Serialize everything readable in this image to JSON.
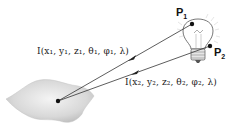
{
  "diagram": {
    "points": [
      {
        "id": "P1",
        "label": "P",
        "subscript": "1"
      },
      {
        "id": "P2",
        "label": "P",
        "subscript": "2"
      }
    ],
    "rays": [
      {
        "from": "P1",
        "label": "I(x₁, y₁, z₁, θ₁, φ₁, λ)"
      },
      {
        "from": "P2",
        "label": "I(x₂, y₂, z₂, θ₂, φ₂, λ)"
      }
    ],
    "objects": {
      "light_source": "light-bulb",
      "surface": "gray-surface-patch"
    },
    "colors": {
      "line": "#333333",
      "surface": "#d6d6d6",
      "bulb_outline": "#555555"
    }
  }
}
